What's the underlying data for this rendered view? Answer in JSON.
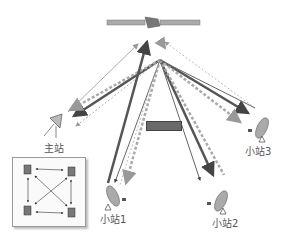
{
  "diagram": {
    "type": "satellite-vsat-network",
    "satellite": {
      "icon": "satellite-icon"
    },
    "stations": [
      {
        "id": "master",
        "label": "主站"
      },
      {
        "id": "vsat1",
        "label": "小站1"
      },
      {
        "id": "vsat2",
        "label": "小站2"
      },
      {
        "id": "vsat3",
        "label": "小站3"
      }
    ],
    "center_tag": "",
    "inset": {
      "description": "mesh of 4 stations interconnected"
    },
    "colors": {
      "solid_dark": "#444444",
      "dashed": "#999999",
      "light": "#bbbbbb"
    }
  }
}
